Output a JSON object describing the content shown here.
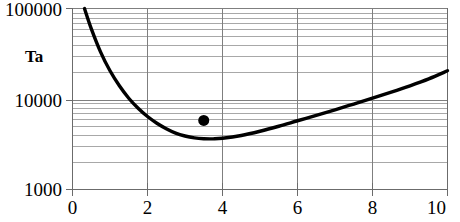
{
  "chart_data": {
    "type": "line",
    "title": "",
    "subtitle": "",
    "xlabel": "",
    "ylabel": "Ta",
    "yscale": "log",
    "xscale": "linear",
    "xlim": [
      0,
      10
    ],
    "ylim": [
      1000,
      100000
    ],
    "grid": true,
    "grid_minor": true,
    "legend": "none",
    "xticks": [
      0,
      2,
      4,
      6,
      8,
      10
    ],
    "xtick_labels": [
      "0",
      "2",
      "4",
      "6",
      "8",
      "10"
    ],
    "yticks": [
      1000,
      10000,
      100000
    ],
    "ytick_labels": [
      "1000",
      "10000",
      "100000"
    ],
    "series": [
      {
        "name": "curve",
        "type": "line",
        "color": "#000000",
        "linewidth": 3.4,
        "x": [
          0.32,
          0.5,
          0.75,
          1.0,
          1.25,
          1.5,
          1.75,
          2.0,
          2.25,
          2.5,
          2.75,
          3.0,
          3.25,
          3.5,
          3.75,
          4.0,
          4.5,
          5.0,
          5.5,
          6.0,
          6.5,
          7.0,
          7.5,
          8.0,
          8.5,
          9.0,
          9.5,
          10.0
        ],
        "y": [
          100000,
          60000,
          33000,
          20500,
          14000,
          10200,
          7900,
          6400,
          5400,
          4700,
          4200,
          3900,
          3720,
          3640,
          3630,
          3680,
          3950,
          4400,
          5000,
          5750,
          6600,
          7600,
          8800,
          10200,
          11900,
          14000,
          16700,
          20500
        ]
      },
      {
        "name": "data-point",
        "type": "scatter",
        "color": "#000000",
        "marker": "circle",
        "marker_size": 11,
        "x": [
          3.5
        ],
        "y": [
          5800
        ]
      }
    ],
    "axis_color": "#808080",
    "gridline_color_major": "#8c8c8c",
    "gridline_color_minor": "#a8a8a8"
  },
  "axes": {
    "y_title": "Ta",
    "y_labels": [
      "100000",
      "10000",
      "1000"
    ],
    "x_labels": [
      "0",
      "2",
      "4",
      "6",
      "8",
      "10"
    ]
  }
}
